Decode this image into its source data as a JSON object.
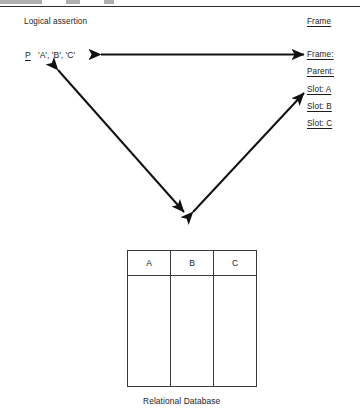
{
  "diagram": {
    "title_left": "Logical assertion",
    "title_right": "Frame",
    "assertion": {
      "predicate": "P",
      "arguments": "'A', 'B', 'C'"
    },
    "frame_fields": [
      {
        "label": "Frame:"
      },
      {
        "label": "Parent:"
      },
      {
        "label": "Slot: A"
      },
      {
        "label": "Slot: B"
      },
      {
        "label": "Slot: C"
      }
    ],
    "table": {
      "caption": "Relational Database",
      "columns": [
        "A",
        "B",
        "C"
      ],
      "rows": [
        [
          "",
          "",
          ""
        ]
      ]
    },
    "arrows": [
      {
        "name": "assertion-frame-arrow",
        "style": "double-headed"
      },
      {
        "name": "assertion-database-arrow",
        "style": "double-headed"
      },
      {
        "name": "database-frame-arrow",
        "style": "double-headed"
      }
    ],
    "colors": {
      "ink": "#1d1d1d",
      "rule": "#2b2b2b",
      "table_border": "#3a3a3a",
      "page": "#ffffff"
    }
  }
}
